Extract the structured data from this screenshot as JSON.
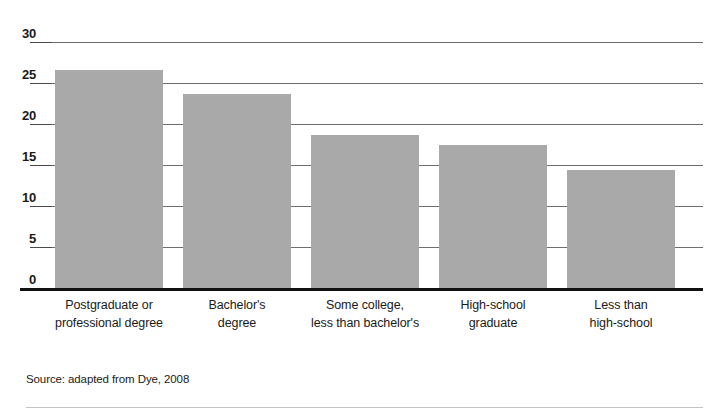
{
  "chart_data": {
    "type": "bar",
    "title": "",
    "subtitle": "",
    "xlabel": "",
    "ylabel": "",
    "ylim": [
      0,
      30
    ],
    "yticks": [
      0,
      5,
      10,
      15,
      20,
      25,
      30
    ],
    "ytick_labels": [
      "0",
      "5",
      "10",
      "15",
      "20",
      "25",
      "30"
    ],
    "grid": true,
    "legend": false,
    "categories": [
      "Postgraduate or professional degree",
      "Bachelor's degree",
      "Some college, less than bachelor's",
      "High-school graduate",
      "Less than high-school"
    ],
    "values": [
      26.6,
      23.7,
      18.6,
      17.4,
      14.4
    ],
    "bar_color": "#a9a9a9",
    "axis_color": "#111111",
    "gridline_color": "#6e6e6e"
  },
  "axis": {
    "ticks": [
      {
        "label": "30",
        "value": 30
      },
      {
        "label": "25",
        "value": 25
      },
      {
        "label": "20",
        "value": 20
      },
      {
        "label": "15",
        "value": 15
      },
      {
        "label": "10",
        "value": 10
      },
      {
        "label": "5",
        "value": 5
      },
      {
        "label": "0",
        "value": 0
      }
    ]
  },
  "categories": [
    {
      "line1": "Postgraduate or",
      "line2": "professional degree"
    },
    {
      "line1": "Bachelor's",
      "line2": "degree"
    },
    {
      "line1": "Some college,",
      "line2": "less than bachelor's"
    },
    {
      "line1": "High-school",
      "line2": "graduate"
    },
    {
      "line1": "Less than",
      "line2": "high-school"
    }
  ],
  "footer": {
    "source": "Source: adapted from Dye, 2008"
  }
}
